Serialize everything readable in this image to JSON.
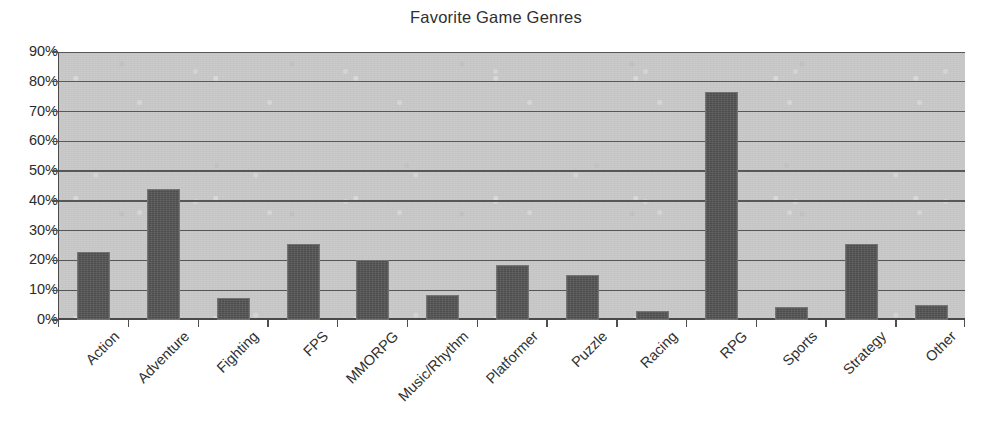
{
  "chart_data": {
    "type": "bar",
    "title": "Favorite Game Genres",
    "xlabel": "",
    "ylabel": "",
    "ylim": [
      0,
      90
    ],
    "ytick_labels": [
      "0%",
      "10%",
      "20%",
      "30%",
      "40%",
      "50%",
      "60%",
      "70%",
      "80%",
      "90%"
    ],
    "ytick_values": [
      0,
      10,
      20,
      30,
      40,
      50,
      60,
      70,
      80,
      90
    ],
    "grid": true,
    "legend": "none",
    "categories": [
      "Action",
      "Adventure",
      "Fighting",
      "FPS",
      "MMORPG",
      "Music/Rhythm",
      "Platformer",
      "Puzzle",
      "Racing",
      "RPG",
      "Sports",
      "Strategy",
      "Other"
    ],
    "values": [
      23,
      44,
      7.5,
      25.5,
      20,
      8.5,
      18.5,
      15,
      3,
      76.5,
      4.5,
      25.5,
      5
    ],
    "colors": {
      "bar_fill": "#565656",
      "bar_stroke": "#747474",
      "plot_background": "#c9c9c9",
      "gridline": "#575757",
      "axis": "#4a4a4a",
      "text": "#2b2b2b",
      "page_background": "#ffffff"
    }
  }
}
